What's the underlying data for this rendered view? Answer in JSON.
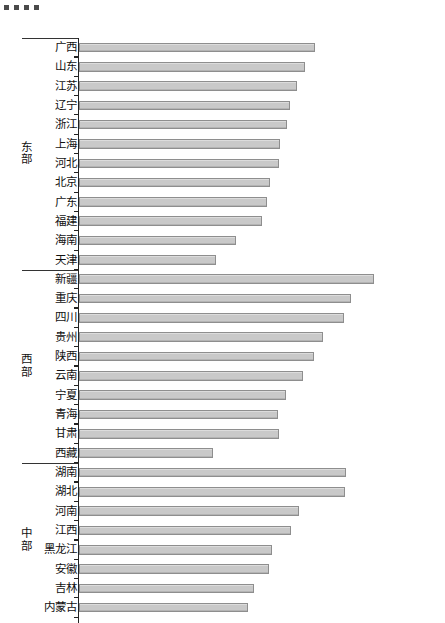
{
  "scan_marks": {
    "count": 4,
    "color": "#4a4a4a"
  },
  "chart_data": {
    "type": "bar",
    "orientation": "horizontal",
    "title": "",
    "subtitle": "",
    "xlabel": "",
    "ylabel": "",
    "grid": false,
    "legend": false,
    "axis_origin_px": 78,
    "x_axis_visible": false,
    "note": "Horizontal bar chart of Chinese provinces grouped into three regions. No numeric axis labels are printed on the figure; values are read from bar pixel lengths relative to the category axis.",
    "groups": [
      {
        "name": "东部",
        "name_chars": [
          "东",
          "部"
        ],
        "categories": [
          "广西",
          "山东",
          "江苏",
          "辽宁",
          "浙江",
          "上海",
          "河北",
          "北京",
          "广东",
          "福建",
          "海南",
          "天津"
        ],
        "values": [
          236,
          226,
          218,
          211,
          208,
          201,
          200,
          191,
          188,
          183,
          157,
          137
        ]
      },
      {
        "name": "西部",
        "name_chars": [
          "西",
          "部"
        ],
        "categories": [
          "新疆",
          "重庆",
          "四川",
          "贵州",
          "陕西",
          "云南",
          "宁夏",
          "青海",
          "甘肃",
          "西藏"
        ],
        "values": [
          295,
          272,
          265,
          244,
          235,
          224,
          207,
          199,
          200,
          134
        ]
      },
      {
        "name": "中部",
        "name_chars": [
          "中",
          "部"
        ],
        "categories": [
          "湖南",
          "湖北",
          "河南",
          "江西",
          "黑龙江",
          "安徽",
          "吉林",
          "内蒙古"
        ],
        "values": [
          267,
          266,
          220,
          212,
          193,
          190,
          175,
          169
        ]
      }
    ],
    "categories": [
      "广西",
      "山东",
      "江苏",
      "辽宁",
      "浙江",
      "上海",
      "河北",
      "北京",
      "广东",
      "福建",
      "海南",
      "天津",
      "新疆",
      "重庆",
      "四川",
      "贵州",
      "陕西",
      "云南",
      "宁夏",
      "青海",
      "甘肃",
      "西藏",
      "湖南",
      "湖北",
      "河南",
      "江西",
      "黑龙江",
      "安徽",
      "吉林",
      "内蒙古"
    ],
    "values": [
      236,
      226,
      218,
      211,
      208,
      201,
      200,
      191,
      188,
      183,
      157,
      137,
      295,
      272,
      265,
      244,
      235,
      224,
      207,
      199,
      200,
      134,
      267,
      266,
      220,
      212,
      193,
      190,
      175,
      169
    ],
    "xlim": [
      0,
      300
    ],
    "bar_color": "#c9c9c9",
    "bar_border_color": "#8e8e8e"
  }
}
